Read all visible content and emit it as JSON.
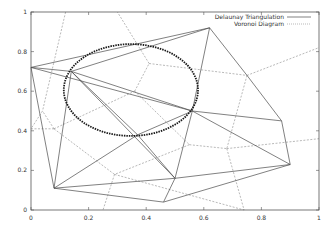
{
  "chart_data": {
    "type": "line",
    "title": "",
    "xlabel": "",
    "ylabel": "",
    "xlim": [
      0,
      1
    ],
    "ylim": [
      0,
      1
    ],
    "grid": false,
    "legend_position": "top-right",
    "x_ticks": [
      "0",
      "0.2",
      "0.4",
      "0.6",
      "0.8",
      "1"
    ],
    "y_ticks": [
      "0",
      "0.2",
      "0.4",
      "0.6",
      "0.8",
      "1"
    ],
    "legend": [
      {
        "label": "Delaunay Triangulation",
        "style": "solid"
      },
      {
        "label": "Voronoi Diagram",
        "style": "dotted"
      }
    ],
    "points": [
      [
        0.0,
        0.72
      ],
      [
        0.14,
        0.7
      ],
      [
        0.62,
        0.92
      ],
      [
        0.08,
        0.11
      ],
      [
        0.37,
        0.38
      ],
      [
        0.56,
        0.5
      ],
      [
        0.75,
        0.68
      ],
      [
        0.87,
        0.45
      ],
      [
        0.9,
        0.23
      ],
      [
        0.46,
        0.04
      ],
      [
        0.5,
        0.16
      ]
    ],
    "series": [
      {
        "name": "Delaunay Triangulation",
        "edges": [
          [
            [
              0.0,
              0.72
            ],
            [
              0.62,
              0.92
            ]
          ],
          [
            [
              0.14,
              0.7
            ],
            [
              0.62,
              0.92
            ]
          ],
          [
            [
              0.0,
              0.72
            ],
            [
              0.14,
              0.7
            ]
          ],
          [
            [
              0.0,
              0.72
            ],
            [
              0.56,
              0.5
            ]
          ],
          [
            [
              0.0,
              0.72
            ],
            [
              0.08,
              0.11
            ]
          ],
          [
            [
              0.14,
              0.7
            ],
            [
              0.08,
              0.11
            ]
          ],
          [
            [
              0.14,
              0.7
            ],
            [
              0.37,
              0.38
            ]
          ],
          [
            [
              0.14,
              0.7
            ],
            [
              0.5,
              0.16
            ]
          ],
          [
            [
              0.14,
              0.7
            ],
            [
              0.56,
              0.5
            ]
          ],
          [
            [
              0.62,
              0.92
            ],
            [
              0.56,
              0.5
            ]
          ],
          [
            [
              0.62,
              0.92
            ],
            [
              0.75,
              0.68
            ]
          ],
          [
            [
              0.75,
              0.68
            ],
            [
              0.87,
              0.45
            ]
          ],
          [
            [
              0.87,
              0.45
            ],
            [
              0.9,
              0.23
            ]
          ],
          [
            [
              0.56,
              0.5
            ],
            [
              0.87,
              0.45
            ]
          ],
          [
            [
              0.56,
              0.5
            ],
            [
              0.9,
              0.23
            ]
          ],
          [
            [
              0.56,
              0.5
            ],
            [
              0.5,
              0.16
            ]
          ],
          [
            [
              0.56,
              0.5
            ],
            [
              0.37,
              0.38
            ]
          ],
          [
            [
              0.37,
              0.38
            ],
            [
              0.08,
              0.11
            ]
          ],
          [
            [
              0.08,
              0.11
            ],
            [
              0.5,
              0.16
            ]
          ],
          [
            [
              0.08,
              0.11
            ],
            [
              0.46,
              0.04
            ]
          ],
          [
            [
              0.46,
              0.04
            ],
            [
              0.5,
              0.16
            ]
          ],
          [
            [
              0.46,
              0.04
            ],
            [
              0.9,
              0.23
            ]
          ],
          [
            [
              0.5,
              0.16
            ],
            [
              0.9,
              0.23
            ]
          ],
          [
            [
              0.5,
              0.16
            ],
            [
              0.37,
              0.38
            ]
          ]
        ]
      },
      {
        "name": "Voronoi Diagram",
        "edges": [
          [
            [
              0.12,
              1.0
            ],
            [
              0.04,
              0.5
            ]
          ],
          [
            [
              0.04,
              0.5
            ],
            [
              0.0,
              0.41
            ]
          ],
          [
            [
              0.0,
              0.41
            ],
            [
              0.08,
              0.41
            ]
          ],
          [
            [
              0.08,
              0.41
            ],
            [
              0.04,
              0.5
            ]
          ],
          [
            [
              0.08,
              0.41
            ],
            [
              0.29,
              0.18
            ]
          ],
          [
            [
              0.08,
              0.41
            ],
            [
              0.36,
              0.6
            ]
          ],
          [
            [
              0.36,
              0.6
            ],
            [
              0.41,
              0.74
            ]
          ],
          [
            [
              0.41,
              0.74
            ],
            [
              0.3,
              1.0
            ]
          ],
          [
            [
              0.41,
              0.74
            ],
            [
              0.75,
              0.68
            ]
          ],
          [
            [
              0.75,
              0.68
            ],
            [
              1.0,
              0.82
            ]
          ],
          [
            [
              0.75,
              0.68
            ],
            [
              0.68,
              0.31
            ]
          ],
          [
            [
              0.36,
              0.6
            ],
            [
              0.55,
              0.33
            ]
          ],
          [
            [
              0.55,
              0.33
            ],
            [
              0.68,
              0.31
            ]
          ],
          [
            [
              0.68,
              0.31
            ],
            [
              1.0,
              0.36
            ]
          ],
          [
            [
              0.55,
              0.33
            ],
            [
              0.29,
              0.18
            ]
          ],
          [
            [
              0.29,
              0.18
            ],
            [
              0.25,
              0.0
            ]
          ],
          [
            [
              0.29,
              0.18
            ],
            [
              0.74,
              0.0
            ]
          ],
          [
            [
              0.68,
              0.31
            ],
            [
              0.74,
              0.0
            ]
          ]
        ]
      }
    ],
    "annotations": [
      {
        "type": "ellipse",
        "cx": 0.347,
        "cy": 0.606,
        "rx": 0.233,
        "ry": 0.232,
        "style": "thick-dashed",
        "label": "circumcircle"
      }
    ]
  }
}
